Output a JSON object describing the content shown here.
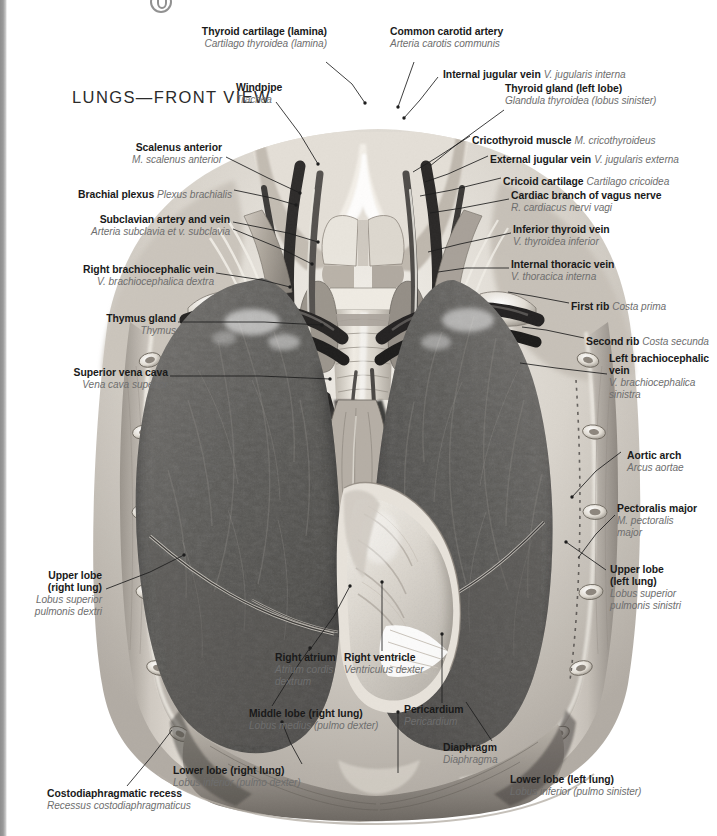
{
  "page": {
    "title": "LUNGS—FRONT VIEW",
    "background": "#ffffff",
    "ink": "#1a1a1a",
    "latin_ink": "#6e6e6e",
    "gutter_color": "#8d8d8d"
  },
  "illustration": {
    "name": "lungs-front-view-anatomical-illustration",
    "style": "grayscale-airbrush-anatomical-plate",
    "subject": "Human thorax, anterior view: opened rib cage showing both lungs, mediastinum, heart within pericardium, great vessels and neck structures"
  },
  "labels": [
    {
      "id": "thyroid-cartilage",
      "en": "Thyroid cartilage (lamina)",
      "la": "Cartilago thyroidea (lamina)",
      "align": "left",
      "inline": false
    },
    {
      "id": "common-carotid-artery",
      "en": "Common carotid artery",
      "la": "Arteria carotis communis",
      "align": "left",
      "inline": false
    },
    {
      "id": "internal-jugular-vein",
      "en": "Internal jugular vein",
      "la": "V. jugularis interna",
      "align": "left",
      "inline": true
    },
    {
      "id": "thyroid-gland-left-lobe",
      "en": "Thyroid gland (left lobe)",
      "la": "Glandula thyroidea (lobus sinister)",
      "align": "left",
      "inline": false
    },
    {
      "id": "windpipe",
      "en": "Windpipe",
      "la": "Trachea",
      "align": "left",
      "inline": false
    },
    {
      "id": "cricothyroid-muscle",
      "en": "Cricothyroid muscle",
      "la": "M. cricothyroideus",
      "align": "left",
      "inline": true
    },
    {
      "id": "external-jugular-vein",
      "en": "External jugular vein",
      "la": "V. jugularis externa",
      "align": "left",
      "inline": true
    },
    {
      "id": "scalenus-anterior",
      "en": "Scalenus anterior",
      "la": "M. scalenus anterior",
      "align": "right",
      "inline": false
    },
    {
      "id": "cricoid-cartilage",
      "en": "Cricoid cartilage",
      "la": "Cartilago cricoidea",
      "align": "left",
      "inline": true
    },
    {
      "id": "cardiac-branch-vagus",
      "en": "Cardiac branch of vagus nerve",
      "la": "R. cardiacus nervi vagi",
      "align": "left",
      "inline": false
    },
    {
      "id": "brachial-plexus",
      "en": "Brachial plexus",
      "la": "Plexus brachialis",
      "align": "right",
      "inline": true
    },
    {
      "id": "subclavian-artery-vein",
      "en": "Subclavian artery and vein",
      "la": "Arteria subclavia et v. subclavia",
      "align": "right",
      "inline": false
    },
    {
      "id": "inferior-thyroid-vein",
      "en": "Inferior thyroid vein",
      "la": "V. thyroidea inferior",
      "align": "left",
      "inline": false
    },
    {
      "id": "internal-thoracic-vein",
      "en": "Internal thoracic vein",
      "la": "V. thoracica interna",
      "align": "left",
      "inline": false
    },
    {
      "id": "right-brachiocephalic-vein",
      "en": "Right brachiocephalic vein",
      "la": "V. brachiocephalica dextra",
      "align": "right",
      "inline": false
    },
    {
      "id": "first-rib",
      "en": "First rib",
      "la": "Costa prima",
      "align": "left",
      "inline": true
    },
    {
      "id": "thymus-gland",
      "en": "Thymus gland",
      "la": "Thymus",
      "align": "right",
      "inline": false
    },
    {
      "id": "second-rib",
      "en": "Second rib",
      "la": "Costa secunda",
      "align": "left",
      "inline": true
    },
    {
      "id": "left-brachiocephalic-vein",
      "en": "Left brachiocephalic\nvein",
      "la": "V. brachiocephalica\nsinistra",
      "align": "left",
      "inline": false
    },
    {
      "id": "superior-vena-cava",
      "en": "Superior vena cava",
      "la": "Vena cava superior",
      "align": "right",
      "inline": false
    },
    {
      "id": "aortic-arch",
      "en": "Aortic arch",
      "la": "Arcus aortae",
      "align": "left",
      "inline": false
    },
    {
      "id": "pectoralis-major",
      "en": "Pectoralis major",
      "la": "M. pectoralis\nmajor",
      "align": "left",
      "inline": false
    },
    {
      "id": "upper-lobe-right-lung",
      "en": "Upper lobe\n(right lung)",
      "la": "Lobus superior\npulmonis dextri",
      "align": "right",
      "inline": false
    },
    {
      "id": "upper-lobe-left-lung",
      "en": "Upper lobe\n(left lung)",
      "la": "Lobus superior\npulmonis sinistri",
      "align": "left",
      "inline": false
    },
    {
      "id": "right-atrium",
      "en": "Right atrium",
      "la": "Atrium cordis\ndextrum",
      "align": "left",
      "inline": false
    },
    {
      "id": "right-ventricle",
      "en": "Right ventricle",
      "la": "Ventriculus dexter",
      "align": "left",
      "inline": false
    },
    {
      "id": "middle-lobe-right-lung",
      "en": "Middle lobe (right lung)",
      "la": "Lobus medius (pulmo dexter)",
      "align": "left",
      "inline": false
    },
    {
      "id": "pericardium",
      "en": "Pericardium",
      "la": "Pericardium",
      "align": "left",
      "inline": false
    },
    {
      "id": "lower-lobe-right-lung",
      "en": "Lower lobe (right lung)",
      "la": "Lobus inferior (pulmo dexter)",
      "align": "left",
      "inline": false
    },
    {
      "id": "diaphragm",
      "en": "Diaphragm",
      "la": "Diaphragma",
      "align": "left",
      "inline": false
    },
    {
      "id": "lower-lobe-left-lung",
      "en": "Lower lobe (left lung)",
      "la": "Lobus inferior (pulmo sinister)",
      "align": "left",
      "inline": false
    },
    {
      "id": "costodiaphragmatic-recess",
      "en": "Costodiaphragmatic recess",
      "la": "Recessus costodiaphragmaticus",
      "align": "left",
      "inline": false
    }
  ]
}
